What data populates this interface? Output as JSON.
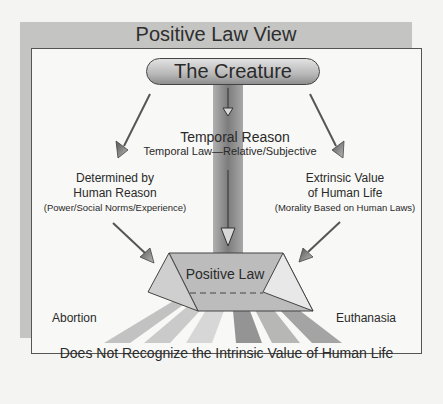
{
  "title": "Positive Law View",
  "top_node": "The Creature",
  "center": {
    "heading": "Temporal Reason",
    "subheading": "Temporal Law—Relative/Subjective"
  },
  "left_branch": {
    "line1": "Determined by",
    "line2": "Human Reason",
    "detail": "(Power/Social Norms/Experience)"
  },
  "right_branch": {
    "line1": "Extrinsic Value",
    "line2": "of Human Life",
    "detail": "(Morality Based on Human Laws)"
  },
  "prism_label": "Positive Law",
  "outcomes": {
    "left": "Abortion",
    "right": "Euthanasia"
  },
  "conclusion": "Does Not Recognize the Intrinsic Value of Human Life",
  "colors": {
    "band": "#c4c4c2",
    "panel": "#f8f8f6",
    "pillar": "#8a8a8a",
    "ray_light": "#c8c8c8",
    "ray_dark": "#8e8e8e"
  }
}
